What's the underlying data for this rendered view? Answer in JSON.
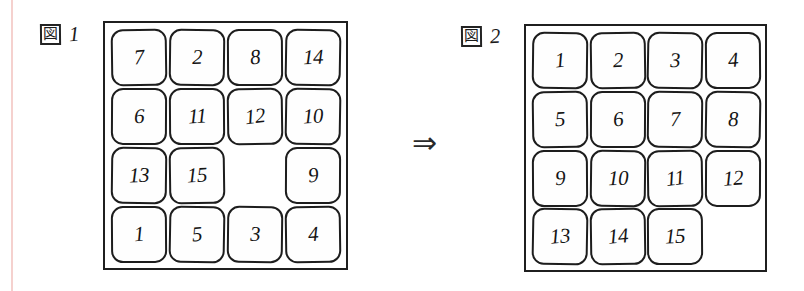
{
  "page": {
    "background_color": "#ffffff",
    "ink_color": "#1d1d1d",
    "margin_rule_color": "#f3c9c6"
  },
  "figures": [
    {
      "label_kanji": "図",
      "label_number": "1",
      "caption": "図 1",
      "rows": [
        [
          "7",
          "2",
          "8",
          "14"
        ],
        [
          "6",
          "11",
          "12",
          "10"
        ],
        [
          "13",
          "15",
          "",
          "9"
        ],
        [
          "1",
          "5",
          "3",
          "4"
        ]
      ],
      "blank_cell": {
        "row": 2,
        "col": 2
      }
    },
    {
      "label_kanji": "図",
      "label_number": "2",
      "caption": "図 2",
      "rows": [
        [
          "1",
          "2",
          "3",
          "4"
        ],
        [
          "5",
          "6",
          "7",
          "8"
        ],
        [
          "9",
          "10",
          "11",
          "12"
        ],
        [
          "13",
          "14",
          "15",
          ""
        ]
      ],
      "blank_cell": {
        "row": 3,
        "col": 3
      }
    }
  ],
  "arrow": {
    "glyph": "⇒",
    "name": "double-right-arrow"
  }
}
